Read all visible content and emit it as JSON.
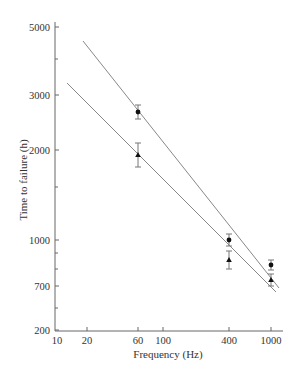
{
  "chart_data": {
    "type": "scatter",
    "title": "",
    "xlabel": "Frequency (Hz)",
    "ylabel": "Time to failure (h)",
    "xscale": "log",
    "yscale": "log",
    "xlim": [
      10,
      1100
    ],
    "ylim": [
      200,
      5000
    ],
    "grid": false,
    "legend": null,
    "x_ticks": [
      {
        "value": 10,
        "label": "10",
        "px": 57
      },
      {
        "value": 20,
        "label": "20",
        "px": 87
      },
      {
        "value": 60,
        "label": "60",
        "px": 138
      },
      {
        "value": 100,
        "label": "100",
        "px": 163
      },
      {
        "value": 400,
        "label": "400",
        "px": 229
      },
      {
        "value": 1000,
        "label": "1000",
        "px": 271
      }
    ],
    "y_ticks": [
      {
        "value": 5000,
        "label": "5000",
        "px": 27
      },
      {
        "value": 3000,
        "label": "3000",
        "px": 95
      },
      {
        "value": 2000,
        "label": "2000",
        "px": 150
      },
      {
        "value": 1000,
        "label": "1000",
        "px": 240
      },
      {
        "value": 700,
        "label": "700",
        "px": 286
      },
      {
        "value": 200,
        "label": "200",
        "px": 330
      }
    ],
    "y_minor_ticks_px": [
      59,
      187,
      253,
      269,
      308
    ],
    "series": [
      {
        "name": "circles",
        "marker": "circle",
        "x": [
          60,
          400,
          1000
        ],
        "values": [
          2650,
          1000,
          820
        ],
        "error": [
          150,
          70,
          60
        ],
        "px": [
          [
            138,
            112,
            7
          ],
          [
            229,
            240,
            6
          ],
          [
            271,
            265,
            5
          ]
        ],
        "fit_line": {
          "from": [
            20,
            4300
          ],
          "to": [
            1100,
            640
          ],
          "px": [
            [
              83,
              41
            ],
            [
              279,
              288
            ]
          ]
        }
      },
      {
        "name": "triangles",
        "marker": "triangle",
        "x": [
          60,
          400,
          1000
        ],
        "values": [
          1900,
          850,
          720
        ],
        "error": [
          180,
          90,
          50
        ],
        "px": [
          [
            138,
            155,
            12
          ],
          [
            229,
            260,
            9
          ],
          [
            271,
            280,
            6
          ]
        ],
        "fit_line": {
          "from": [
            14,
            3300
          ],
          "to": [
            1100,
            620
          ],
          "px": [
            [
              67,
              83
            ],
            [
              276,
              292
            ]
          ]
        }
      }
    ]
  }
}
